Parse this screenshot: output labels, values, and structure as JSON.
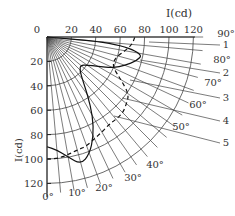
{
  "chart_data": {
    "type": "polar",
    "title": "",
    "origin_px": [
      47,
      37
    ],
    "px_per_cd": 1.22,
    "axis_label_x": "I(cd)",
    "axis_label_y": "I(cd)",
    "radial_ticks": [
      20,
      40,
      60,
      80,
      100,
      120
    ],
    "x_tick_labels": [
      "0",
      "20",
      "40",
      "60",
      "80",
      "100",
      "120"
    ],
    "y_tick_labels": [
      "20",
      "40",
      "60",
      "80",
      "100",
      "120"
    ],
    "arc_radii": [
      20,
      40,
      60,
      80,
      100,
      120
    ],
    "angle_lines_deg": [
      0,
      5,
      10,
      15,
      20,
      25,
      30,
      35,
      40,
      45,
      50,
      55,
      60,
      65,
      70,
      75,
      80,
      85,
      90
    ],
    "angle_labels": [
      "0°",
      "10°",
      "20°",
      "30°",
      "40°",
      "50°",
      "60°",
      "70°",
      "80°",
      "90°"
    ],
    "curve_labels": [
      "1",
      "2",
      "3",
      "4",
      "5"
    ],
    "curves": [
      {
        "name": "solid",
        "style": "solid",
        "points_deg_cd": [
          [
            0,
            90
          ],
          [
            5,
            93
          ],
          [
            10,
            100
          ],
          [
            15,
            108
          ],
          [
            20,
            102
          ],
          [
            25,
            90
          ],
          [
            30,
            75
          ],
          [
            35,
            58
          ],
          [
            40,
            45
          ],
          [
            45,
            38
          ],
          [
            50,
            36
          ],
          [
            55,
            40
          ],
          [
            60,
            48
          ],
          [
            65,
            60
          ],
          [
            70,
            68
          ],
          [
            75,
            76
          ],
          [
            80,
            80
          ],
          [
            85,
            55
          ],
          [
            90,
            0
          ]
        ]
      },
      {
        "name": "dashed",
        "style": "dashed",
        "points_deg_cd": [
          [
            0,
            100
          ],
          [
            5,
            100
          ],
          [
            10,
            98
          ],
          [
            15,
            96
          ],
          [
            20,
            95
          ],
          [
            25,
            92
          ],
          [
            30,
            90
          ],
          [
            35,
            88
          ],
          [
            40,
            88
          ],
          [
            45,
            88
          ],
          [
            50,
            85
          ],
          [
            55,
            82
          ],
          [
            60,
            70
          ],
          [
            65,
            60
          ],
          [
            70,
            58
          ],
          [
            75,
            60
          ],
          [
            80,
            65
          ],
          [
            85,
            70
          ],
          [
            90,
            72
          ]
        ]
      }
    ],
    "grid": true
  },
  "labels": {
    "axis_x": "I(cd)",
    "axis_y": "I(cd)",
    "origin": "0"
  }
}
